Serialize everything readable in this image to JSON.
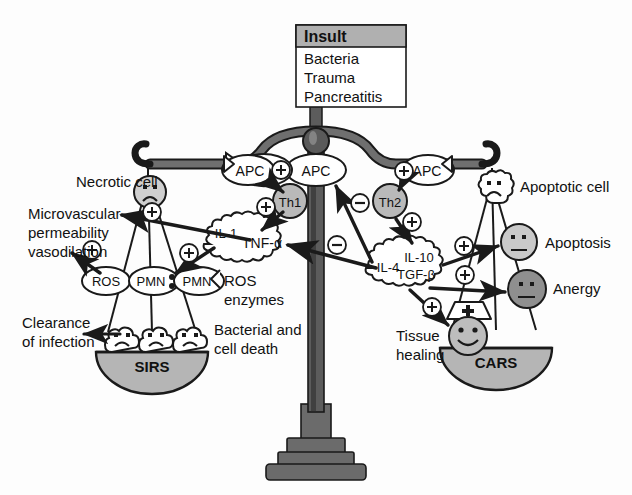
{
  "diagram": {
    "background_color": "#fdfdfd",
    "ink_color": "#1a1a1a",
    "fill_white": "#ffffff",
    "fill_light_gray": "#c9c9c9",
    "fill_mid_gray": "#a8a8a8",
    "fill_dark_gray": "#8f8f8f",
    "fill_beam_gray": "#636363",
    "fill_header_gray": "#b0b0b0"
  },
  "insult_box": {
    "header": "Insult",
    "items": [
      "Bacteria",
      "Trauma",
      "Pancreatitis"
    ]
  },
  "beam": {
    "name": "balance-beam",
    "pivot_label": "pivot"
  },
  "center": {
    "apc_label": "APC"
  },
  "left": {
    "necrotic_cell_label": "Necrotic cell",
    "apc_label": "APC",
    "th1_label": "Th1",
    "cytokines": {
      "il1": "IL-1",
      "tnfa": "TNF-α"
    },
    "ros_label": "ROS",
    "pmn_label_1": "PMN",
    "pmn_label_2": "PMN",
    "ros_enzymes_line1": "ROS",
    "ros_enzymes_line2": "enzymes",
    "microvascular_line1": "Microvascular",
    "microvascular_line2": "permeability",
    "microvascular_line3": "vasodilation",
    "clearance_line1": "Clearance",
    "clearance_line2": "of infection",
    "bacterial_line1": "Bacterial and",
    "bacterial_line2": "cell death",
    "pan_label": "SIRS"
  },
  "right": {
    "apoptotic_cell_label": "Apoptotic cell",
    "apc_label": "APC",
    "th2_label": "Th2",
    "cytokines": {
      "il4": "IL-4",
      "il10": "IL-10",
      "tgfb": "TGF-β"
    },
    "apoptosis_label": "Apoptosis",
    "anergy_label": "Anergy",
    "tissue_healing_line1": "Tissue",
    "tissue_healing_line2": "healing",
    "pan_label": "CARS"
  },
  "signs": {
    "plus": "+",
    "minus": "−",
    "plus_count": 7,
    "minus_count": 2,
    "plus_positions_desc": [
      "left-apc-to-th1",
      "left-th1-to-cytokines",
      "left-necrotic-to-microvascular",
      "left-ros-arrow",
      "right-apc-to-th2",
      "right-th2-to-cytokines",
      "right-cytokines-to-apoptosis",
      "right-cytokines-to-anergy",
      "right-cytokines-to-tissue-healing"
    ],
    "minus_positions_desc": [
      "center-right-to-apc",
      "center-right-to-tnf-cloud"
    ]
  },
  "icons": {
    "sad_face": "sad-face-icon",
    "neutral_face": "neutral-face-icon",
    "happy_face": "happy-face-icon",
    "nurse_cap": "nurse-cap-icon",
    "cloud": "cytokine-cloud-icon",
    "cell": "cell-shape-icon"
  }
}
